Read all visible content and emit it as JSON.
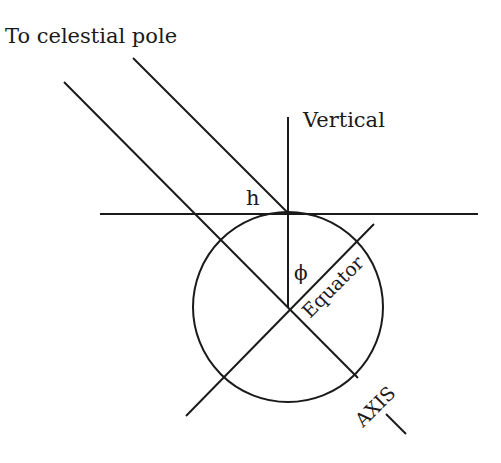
{
  "labels": {
    "title": "To celestial pole",
    "vertical": "Vertical",
    "h": "h",
    "phi": "ϕ",
    "equator": "Equator",
    "axis": "AXIS"
  },
  "colors": {
    "ink": "#1a1a1a",
    "background": "#ffffff"
  }
}
